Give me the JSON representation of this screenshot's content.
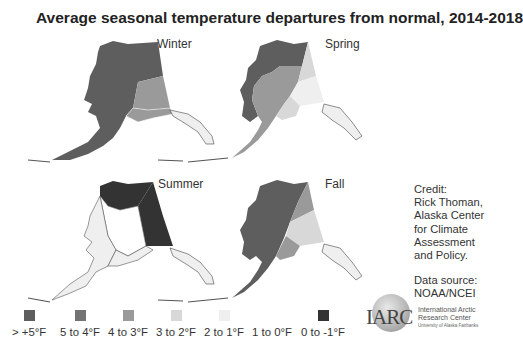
{
  "title": "Average seasonal temperature departures from normal, 2014-2018",
  "panels": [
    {
      "season": "Winter",
      "regions": {
        "west": "> +5°F",
        "northeast": "> +5°F",
        "east_interior": "4 to 3°F",
        "southcentral": "4 to 3°F",
        "southeast": "2 to 1°F"
      }
    },
    {
      "season": "Spring",
      "regions": {
        "west": "> +5°F",
        "north": "> +5°F",
        "central": "4 to 3°F",
        "northeast": "3 to 2°F",
        "east_interior": "2 to 1°F",
        "southcentral": "3 to 2°F",
        "southeast": "2 to 1°F"
      }
    },
    {
      "season": "Summer",
      "regions": {
        "north": "0 to -1°F",
        "northeast": "0 to -1°F",
        "east_interior": "0 to -1°F",
        "west": "2 to 1°F",
        "central": "1 to 0°F",
        "southcentral": "2 to 1°F",
        "southeast": "2 to 1°F"
      }
    },
    {
      "season": "Fall",
      "regions": {
        "west": "> +5°F",
        "northeast": "4 to 3°F",
        "east_interior": "3 to 2°F",
        "southcentral": "4 to 3°F",
        "southeast": "2 to 1°F"
      }
    }
  ],
  "legend": [
    {
      "label": "> +5°F",
      "color": "#5e5e5e"
    },
    {
      "label": "5 to 4°F",
      "color": "#737373"
    },
    {
      "label": "4 to 3°F",
      "color": "#9a9a9a"
    },
    {
      "label": "3 to 2°F",
      "color": "#d8d8d8"
    },
    {
      "label": "2 to 1°F",
      "color": "#efefef"
    },
    {
      "label": "1 to 0°F",
      "color": "#ffffff"
    },
    {
      "label": "0 to -1°F",
      "color": "#333333"
    }
  ],
  "credit": {
    "lines": [
      "Credit:",
      "Rick Thoman,",
      "Alaska Center",
      "for Climate",
      "Assessment",
      "and Policy."
    ],
    "source_lines": [
      "Data source:",
      "NOAA/NCEI"
    ]
  },
  "logo": {
    "mark": "IARC",
    "line1": "International Arctic",
    "line2": "Research Center",
    "line3": "University of Alaska Fairbanks"
  }
}
